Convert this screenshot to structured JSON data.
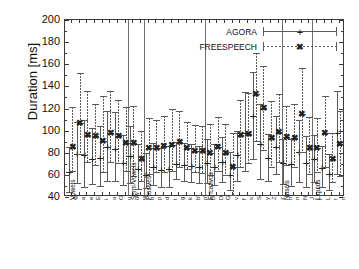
{
  "chart_data": {
    "type": "scatter",
    "title": "",
    "xlabel": "",
    "ylabel": "Duration [ms]",
    "ylim": [
      40,
      200
    ],
    "yticks": [
      40,
      60,
      80,
      100,
      120,
      140,
      160,
      180,
      200
    ],
    "grid": false,
    "legend_position": "top-right",
    "legend": [
      "AGORA",
      "FREESPEECH"
    ],
    "groups": [
      {
        "label": "Vowels",
        "phonemes": [
          "@",
          "a",
          "e",
          "E",
          "i",
          "o",
          "O",
          "u"
        ]
      },
      {
        "label": "Semi-Vowels",
        "phonemes": [
          "uw",
          "w"
        ]
      },
      {
        "label": "Plosives",
        "phonemes": [
          "b",
          "p",
          "d",
          "t",
          "g",
          "k",
          "b'",
          "p'"
        ]
      },
      {
        "label": "Fricativos",
        "phonemes": [
          "B",
          "D",
          "G",
          "v",
          "f",
          "s",
          "S",
          "y",
          "Z",
          "z"
        ]
      },
      {
        "label": "Nasals",
        "phonemes": [
          "m",
          "n",
          "N",
          "J"
        ]
      },
      {
        "label": "Liquids",
        "phonemes": [
          "l",
          "L",
          "r",
          "rr"
        ]
      }
    ],
    "series": [
      {
        "name": "AGORA",
        "marker": "+",
        "line": "solid",
        "points": [
          {
            "x": "@",
            "value": 63,
            "low": 44,
            "high": 85
          },
          {
            "x": "a",
            "value": 79,
            "low": 52,
            "high": 108
          },
          {
            "x": "e",
            "value": 78,
            "low": 48,
            "high": 110
          },
          {
            "x": "E",
            "value": 74,
            "low": 51,
            "high": 102
          },
          {
            "x": "i",
            "value": 75,
            "low": 49,
            "high": 104
          },
          {
            "x": "o",
            "value": 85,
            "low": 54,
            "high": 118
          },
          {
            "x": "O",
            "value": 83,
            "low": 54,
            "high": 117
          },
          {
            "x": "u",
            "value": 71,
            "low": 50,
            "high": 96
          },
          {
            "x": "uw",
            "value": 77,
            "low": 52,
            "high": 104
          },
          {
            "x": "w",
            "value": 65,
            "low": 46,
            "high": 88
          },
          {
            "x": "b",
            "value": 60,
            "low": 47,
            "high": 80
          },
          {
            "x": "p",
            "value": 67,
            "low": 50,
            "high": 89
          },
          {
            "x": "d",
            "value": 64,
            "low": 48,
            "high": 84
          },
          {
            "x": "t",
            "value": 65,
            "low": 48,
            "high": 86
          },
          {
            "x": "g",
            "value": 70,
            "low": 55,
            "high": 90
          },
          {
            "x": "k",
            "value": 69,
            "low": 54,
            "high": 89
          },
          {
            "x": "b'",
            "value": 68,
            "low": 53,
            "high": 88
          },
          {
            "x": "p'",
            "value": 67,
            "low": 52,
            "high": 86
          },
          {
            "x": "B",
            "value": 71,
            "low": 52,
            "high": 92
          },
          {
            "x": "D",
            "value": 67,
            "low": 50,
            "high": 88
          },
          {
            "x": "G",
            "value": 72,
            "low": 53,
            "high": 94
          },
          {
            "x": "v",
            "value": 60,
            "low": 45,
            "high": 81
          },
          {
            "x": "f",
            "value": 78,
            "low": 54,
            "high": 100
          },
          {
            "x": "s",
            "value": 98,
            "low": 63,
            "high": 135
          },
          {
            "x": "S",
            "value": 113,
            "low": 73,
            "high": 153
          },
          {
            "x": "y",
            "value": 88,
            "low": 55,
            "high": 124
          },
          {
            "x": "Z",
            "value": 75,
            "low": 54,
            "high": 97
          },
          {
            "x": "z",
            "value": 85,
            "low": 60,
            "high": 113
          },
          {
            "x": "m",
            "value": 71,
            "low": 51,
            "high": 92
          },
          {
            "x": "n",
            "value": 70,
            "low": 49,
            "high": 92
          },
          {
            "x": "N",
            "value": 81,
            "low": 53,
            "high": 110
          },
          {
            "x": "J",
            "value": 71,
            "low": 48,
            "high": 95
          },
          {
            "x": "l",
            "value": 74,
            "low": 53,
            "high": 96
          },
          {
            "x": "L",
            "value": 66,
            "low": 48,
            "high": 86
          },
          {
            "x": "r",
            "value": 61,
            "low": 45,
            "high": 79
          },
          {
            "x": "rr",
            "value": 98,
            "low": 60,
            "high": 136
          }
        ]
      },
      {
        "name": "FREESPEECH",
        "marker": "x",
        "line": "dashed",
        "points": [
          {
            "x": "@",
            "value": 85,
            "low": 63,
            "high": 121
          },
          {
            "x": "a",
            "value": 107,
            "low": 78,
            "high": 152
          },
          {
            "x": "e",
            "value": 96,
            "low": 71,
            "high": 136
          },
          {
            "x": "E",
            "value": 95,
            "low": 68,
            "high": 124
          },
          {
            "x": "i",
            "value": 91,
            "low": 62,
            "high": 131
          },
          {
            "x": "o",
            "value": 98,
            "low": 71,
            "high": 136
          },
          {
            "x": "O",
            "value": 95,
            "low": 70,
            "high": 128
          },
          {
            "x": "u",
            "value": 89,
            "low": 63,
            "high": 121
          },
          {
            "x": "uw",
            "value": 89,
            "low": 58,
            "high": 122
          },
          {
            "x": "w",
            "value": 74,
            "low": 54,
            "high": 100
          },
          {
            "x": "b",
            "value": 84,
            "low": 60,
            "high": 111
          },
          {
            "x": "p",
            "value": 84,
            "low": 62,
            "high": 110
          },
          {
            "x": "d",
            "value": 86,
            "low": 62,
            "high": 113
          },
          {
            "x": "t",
            "value": 87,
            "low": 63,
            "high": 120
          },
          {
            "x": "g",
            "value": 90,
            "low": 66,
            "high": 118
          },
          {
            "x": "k",
            "value": 84,
            "low": 64,
            "high": 108
          },
          {
            "x": "b'",
            "value": 82,
            "low": 62,
            "high": 105
          },
          {
            "x": "p'",
            "value": 82,
            "low": 61,
            "high": 104
          },
          {
            "x": "B",
            "value": 80,
            "low": 59,
            "high": 106
          },
          {
            "x": "D",
            "value": 85,
            "low": 63,
            "high": 112
          },
          {
            "x": "G",
            "value": 80,
            "low": 59,
            "high": 106
          },
          {
            "x": "v",
            "value": 67,
            "low": 41,
            "high": 98
          },
          {
            "x": "f",
            "value": 96,
            "low": 66,
            "high": 128
          },
          {
            "x": "s",
            "value": 97,
            "low": 70,
            "high": 134
          },
          {
            "x": "S",
            "value": 133,
            "low": 90,
            "high": 170
          },
          {
            "x": "y",
            "value": 120,
            "low": 82,
            "high": 158
          },
          {
            "x": "Z",
            "value": 93,
            "low": 66,
            "high": 127
          },
          {
            "x": "z",
            "value": 99,
            "low": 71,
            "high": 133
          },
          {
            "x": "m",
            "value": 94,
            "low": 68,
            "high": 122
          },
          {
            "x": "n",
            "value": 93,
            "low": 66,
            "high": 124
          },
          {
            "x": "N",
            "value": 115,
            "low": 80,
            "high": 157
          },
          {
            "x": "J",
            "value": 84,
            "low": 60,
            "high": 112
          },
          {
            "x": "l",
            "value": 84,
            "low": 62,
            "high": 111
          },
          {
            "x": "L",
            "value": 98,
            "low": 66,
            "high": 131
          },
          {
            "x": "r",
            "value": 74,
            "low": 53,
            "high": 98
          },
          {
            "x": "rr",
            "value": 88,
            "low": 58,
            "high": 118
          }
        ]
      }
    ]
  }
}
